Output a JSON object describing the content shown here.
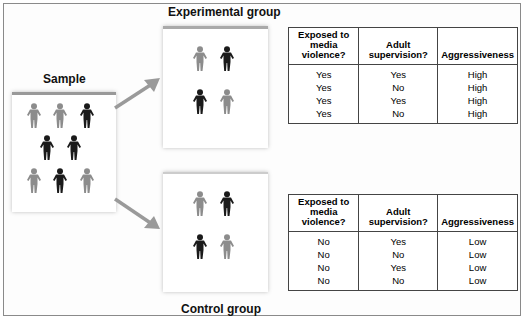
{
  "labels": {
    "sample": "Sample",
    "experimental": "Experimental group",
    "control": "Control group"
  },
  "colors": {
    "light_figure": "#8c8c8c",
    "dark_figure": "#1a1a1a",
    "arrow": "#9a9a9a"
  },
  "tables": {
    "experimental": {
      "headers": [
        "Exposed to media violence?",
        "Adult supervision?",
        "Aggressiveness"
      ],
      "rows": [
        [
          "Yes",
          "Yes",
          "High"
        ],
        [
          "Yes",
          "No",
          "High"
        ],
        [
          "Yes",
          "Yes",
          "High"
        ],
        [
          "Yes",
          "No",
          "High"
        ]
      ]
    },
    "control": {
      "headers": [
        "Exposed to media violence?",
        "Adult supervision?",
        "Aggressiveness"
      ],
      "rows": [
        [
          "No",
          "Yes",
          "Low"
        ],
        [
          "No",
          "No",
          "Low"
        ],
        [
          "No",
          "Yes",
          "Low"
        ],
        [
          "No",
          "No",
          "Low"
        ]
      ]
    }
  }
}
